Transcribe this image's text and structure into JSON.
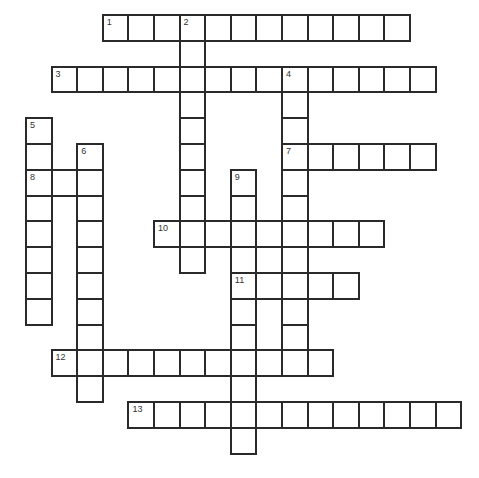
{
  "puzzle": {
    "type": "crossword",
    "header_text": "",
    "grid": {
      "origin_x": 25,
      "origin_y": 14,
      "cell_w": 25.6,
      "cell_h": 25.8,
      "border_color": "#2a2a2a",
      "fill_color": "#ffffff"
    },
    "entries": [
      {
        "number": "1",
        "direction": "across",
        "row": 0,
        "col": 3,
        "length": 12
      },
      {
        "number": "2",
        "direction": "down",
        "row": 0,
        "col": 6,
        "length": 10
      },
      {
        "number": "3",
        "direction": "across",
        "row": 2,
        "col": 1,
        "length": 15
      },
      {
        "number": "4",
        "direction": "down",
        "row": 2,
        "col": 10,
        "length": 12
      },
      {
        "number": "5",
        "direction": "down",
        "row": 4,
        "col": 0,
        "length": 8
      },
      {
        "number": "6",
        "direction": "down",
        "row": 5,
        "col": 2,
        "length": 10
      },
      {
        "number": "7",
        "direction": "across",
        "row": 5,
        "col": 10,
        "length": 6
      },
      {
        "number": "8",
        "direction": "across",
        "row": 6,
        "col": 0,
        "length": 3
      },
      {
        "number": "9",
        "direction": "down",
        "row": 6,
        "col": 8,
        "length": 11
      },
      {
        "number": "10",
        "direction": "across",
        "row": 8,
        "col": 5,
        "length": 9
      },
      {
        "number": "11",
        "direction": "across",
        "row": 10,
        "col": 8,
        "length": 5
      },
      {
        "number": "12",
        "direction": "across",
        "row": 13,
        "col": 1,
        "length": 11
      },
      {
        "number": "13",
        "direction": "across",
        "row": 15,
        "col": 4,
        "length": 13
      }
    ],
    "extra_cells": [
      {
        "row": 9,
        "col": 9
      }
    ]
  }
}
